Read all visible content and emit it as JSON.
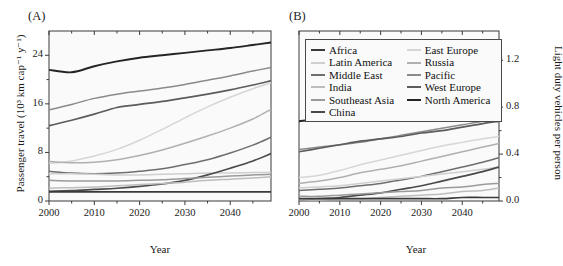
{
  "figure": {
    "panel_a_label": "(A)",
    "panel_b_label": "(B)",
    "xlabel": "Year",
    "ylabel_left": "Passenger travel (10³ km cap⁻¹ y⁻¹)",
    "ylabel_right": "Light duty vehicles per person"
  },
  "legend": {
    "columns": [
      [
        {
          "label": "Africa",
          "color": "#3a3a3a"
        },
        {
          "label": "Latin America",
          "color": "#cfcfcf"
        },
        {
          "label": "Middle East",
          "color": "#6e6e6e"
        },
        {
          "label": "India",
          "color": "#bdbdbd"
        },
        {
          "label": "Southeast Asia",
          "color": "#9a9a9a"
        },
        {
          "label": "China",
          "color": "#4a4a4a"
        }
      ],
      [
        {
          "label": "East Europe",
          "color": "#d6d6d6"
        },
        {
          "label": "Russia",
          "color": "#b0b0b0"
        },
        {
          "label": "Pacific",
          "color": "#8a8a8a"
        },
        {
          "label": "West Europe",
          "color": "#5c5c5c"
        },
        {
          "label": "North America",
          "color": "#242424"
        }
      ]
    ]
  },
  "chart_data": [
    {
      "type": "line",
      "panel": "(A)",
      "title": "",
      "xlabel": "Year",
      "ylabel": "Passenger travel (10³ km cap⁻¹ y⁻¹)",
      "xlim": [
        2000,
        2049
      ],
      "ylim": [
        0,
        28
      ],
      "xticks": [
        2000,
        2010,
        2020,
        2030,
        2040
      ],
      "xticklabels": [
        "2000",
        "2010",
        "2020",
        "2030",
        "2040"
      ],
      "xminorticks": [
        2005,
        2015,
        2025,
        2035,
        2045
      ],
      "yticks": [
        0,
        8,
        16,
        24
      ],
      "yticklabels": [
        "0",
        "8",
        "16",
        "24"
      ],
      "yminorticks": [
        4,
        12,
        20
      ],
      "grid": false,
      "x": [
        2000,
        2005,
        2010,
        2015,
        2020,
        2025,
        2030,
        2035,
        2040,
        2045,
        2049
      ],
      "series": [
        {
          "name": "North America",
          "color": "#242424",
          "values": [
            21.6,
            21.2,
            22.2,
            23.0,
            23.6,
            24.0,
            24.4,
            24.8,
            25.2,
            25.7,
            26.1
          ]
        },
        {
          "name": "Pacific",
          "color": "#8a8a8a",
          "values": [
            15.0,
            15.9,
            16.9,
            17.6,
            18.1,
            18.6,
            19.2,
            19.9,
            20.6,
            21.4,
            22.0
          ]
        },
        {
          "name": "West Europe",
          "color": "#5c5c5c",
          "values": [
            12.4,
            13.3,
            14.3,
            15.4,
            15.9,
            16.4,
            17.0,
            17.6,
            18.3,
            19.1,
            19.8
          ]
        },
        {
          "name": "East Europe",
          "color": "#d6d6d6",
          "values": [
            6.2,
            6.6,
            7.4,
            8.5,
            10.0,
            11.8,
            13.7,
            15.5,
            17.1,
            18.5,
            19.5
          ]
        },
        {
          "name": "Russia",
          "color": "#b0b0b0",
          "values": [
            6.5,
            6.3,
            6.4,
            6.8,
            7.5,
            8.4,
            9.5,
            10.7,
            12.0,
            13.5,
            15.1
          ]
        },
        {
          "name": "Middle East",
          "color": "#6e6e6e",
          "values": [
            4.9,
            4.6,
            4.5,
            4.6,
            4.9,
            5.3,
            6.0,
            6.8,
            7.9,
            9.2,
            10.5
          ]
        },
        {
          "name": "Latin America",
          "color": "#cfcfcf",
          "values": [
            4.5,
            4.5,
            4.4,
            4.3,
            4.3,
            4.4,
            4.5,
            4.6,
            4.6,
            4.7,
            4.7
          ]
        },
        {
          "name": "China",
          "color": "#4a4a4a",
          "values": [
            1.6,
            1.7,
            1.9,
            2.1,
            2.4,
            2.8,
            3.4,
            4.3,
            5.4,
            6.6,
            7.8
          ]
        },
        {
          "name": "Southeast Asia",
          "color": "#9a9a9a",
          "values": [
            3.4,
            3.3,
            3.3,
            3.3,
            3.4,
            3.5,
            3.7,
            3.9,
            4.1,
            4.3,
            4.4
          ]
        },
        {
          "name": "India",
          "color": "#bdbdbd",
          "values": [
            2.1,
            2.2,
            2.3,
            2.5,
            2.7,
            2.9,
            3.1,
            3.4,
            3.6,
            3.8,
            4.0
          ]
        },
        {
          "name": "Africa",
          "color": "#3a3a3a",
          "values": [
            1.5,
            1.5,
            1.5,
            1.5,
            1.5,
            1.5,
            1.5,
            1.5,
            1.5,
            1.5,
            1.5
          ]
        }
      ]
    },
    {
      "type": "line",
      "panel": "(B)",
      "title": "",
      "xlabel": "Year",
      "ylabel": "Light duty vehicles per person",
      "xlim": [
        2000,
        2049
      ],
      "ylim": [
        0.0,
        1.45
      ],
      "xticks": [
        2000,
        2010,
        2020,
        2030,
        2040
      ],
      "xticklabels": [
        "2000",
        "2010",
        "2020",
        "2030",
        "2040"
      ],
      "xminorticks": [
        2005,
        2015,
        2025,
        2035,
        2045
      ],
      "yticks": [
        0.0,
        0.4,
        0.8,
        1.2
      ],
      "yticklabels": [
        "0.0",
        "0.4",
        "0.8",
        "1.2"
      ],
      "yminorticks": [
        0.2,
        0.6,
        1.0
      ],
      "grid": false,
      "x": [
        2000,
        2005,
        2010,
        2015,
        2020,
        2025,
        2030,
        2035,
        2040,
        2045,
        2049
      ],
      "series": [
        {
          "name": "North America",
          "color": "#242424",
          "values": [
            0.68,
            0.7,
            0.71,
            0.73,
            0.74,
            0.75,
            0.77,
            0.78,
            0.79,
            0.81,
            0.82
          ]
        },
        {
          "name": "Pacific",
          "color": "#8a8a8a",
          "values": [
            0.44,
            0.46,
            0.48,
            0.5,
            0.53,
            0.56,
            0.59,
            0.62,
            0.65,
            0.68,
            0.71
          ]
        },
        {
          "name": "West Europe",
          "color": "#5c5c5c",
          "values": [
            0.42,
            0.45,
            0.48,
            0.51,
            0.53,
            0.55,
            0.58,
            0.6,
            0.63,
            0.66,
            0.68
          ]
        },
        {
          "name": "East Europe",
          "color": "#d6d6d6",
          "values": [
            0.2,
            0.22,
            0.26,
            0.31,
            0.35,
            0.39,
            0.43,
            0.47,
            0.5,
            0.53,
            0.55
          ]
        },
        {
          "name": "Russia",
          "color": "#b0b0b0",
          "values": [
            0.15,
            0.17,
            0.2,
            0.24,
            0.27,
            0.3,
            0.34,
            0.38,
            0.42,
            0.46,
            0.49
          ]
        },
        {
          "name": "Middle East",
          "color": "#6e6e6e",
          "values": [
            0.09,
            0.1,
            0.11,
            0.13,
            0.15,
            0.18,
            0.21,
            0.25,
            0.29,
            0.33,
            0.37
          ]
        },
        {
          "name": "Latin America",
          "color": "#cfcfcf",
          "values": [
            0.11,
            0.12,
            0.13,
            0.15,
            0.17,
            0.19,
            0.21,
            0.23,
            0.25,
            0.27,
            0.29
          ]
        },
        {
          "name": "China",
          "color": "#4a4a4a",
          "values": [
            0.01,
            0.02,
            0.03,
            0.05,
            0.07,
            0.1,
            0.13,
            0.17,
            0.21,
            0.25,
            0.29
          ]
        },
        {
          "name": "Southeast Asia",
          "color": "#9a9a9a",
          "values": [
            0.04,
            0.04,
            0.05,
            0.06,
            0.07,
            0.08,
            0.09,
            0.11,
            0.12,
            0.14,
            0.15
          ]
        },
        {
          "name": "India",
          "color": "#bdbdbd",
          "values": [
            0.01,
            0.01,
            0.02,
            0.02,
            0.03,
            0.04,
            0.05,
            0.06,
            0.08,
            0.09,
            0.11
          ]
        },
        {
          "name": "Africa",
          "color": "#3a3a3a",
          "values": [
            0.02,
            0.02,
            0.02,
            0.02,
            0.02,
            0.02,
            0.02,
            0.02,
            0.03,
            0.03,
            0.03
          ]
        }
      ]
    }
  ]
}
